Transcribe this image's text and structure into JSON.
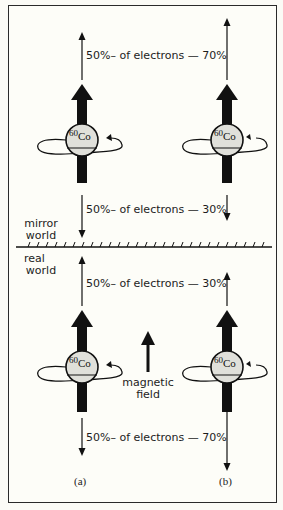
{
  "figure": {
    "regions": {
      "mirror": "mirror\nworld",
      "mirror_line1": "mirror",
      "mirror_line2": "world",
      "real_line1": "real",
      "real_line2": "world"
    },
    "nucleus_label": {
      "mass": "60",
      "element": "Co"
    },
    "field_label_line1": "magnetic",
    "field_label_line2": "field",
    "panels": [
      {
        "id": "a",
        "label": "(a)"
      },
      {
        "id": "b",
        "label": "(b)"
      }
    ],
    "emission_labels": {
      "mirror_up": "50%– of electrons — 70%",
      "mirror_down": "50%– of electrons — 30%",
      "real_up": "50%– of electrons — 30%",
      "real_down": "50%– of electrons — 70%"
    },
    "emission_values": {
      "mirror_world": {
        "a": {
          "up": "50%",
          "down": "50%"
        },
        "b": {
          "up": "70%",
          "down": "30%"
        }
      },
      "real_world": {
        "a": {
          "up": "50%",
          "down": "50%"
        },
        "b": {
          "up": "30%",
          "down": "70%"
        }
      }
    },
    "colors": {
      "ink": "#111111",
      "sphere_fill": "#e0e0da",
      "background": "#fdfdf8"
    }
  }
}
